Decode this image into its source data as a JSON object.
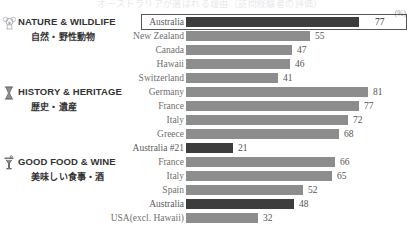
{
  "headline": "オーストラリアが選ばれる理由（訪問経験者の評価）",
  "unit": "(%)",
  "axis": {
    "baseline_px": 186,
    "px_per_unit": 2.25
  },
  "chart_data": {
    "type": "bar",
    "title": "",
    "xlabel": "(%)",
    "ylabel": "",
    "xlim": [
      0,
      100
    ],
    "grid": false,
    "legend": "none",
    "orientation": "horizontal",
    "sections": [
      {
        "icon": "koala-icon",
        "title_en": "NATURE & WILDLIFE",
        "title_ja": "自然・野性動物",
        "categories": [
          "Australia",
          "New Zealand",
          "Canada",
          "Hawaii",
          "Switzerland"
        ],
        "values": [
          77,
          55,
          47,
          46,
          41
        ],
        "highlight_index": 0,
        "boxed_index": 0
      },
      {
        "icon": "hourglass-icon",
        "title_en": "HISTORY & HERITAGE",
        "title_ja": "歴史・遺産",
        "categories": [
          "Germany",
          "France",
          "Italy",
          "Greece",
          "Australia #21"
        ],
        "values": [
          81,
          77,
          72,
          68,
          21
        ],
        "highlight_index": 4,
        "boxed_index": -1
      },
      {
        "icon": "cocktail-glass-icon",
        "title_en": "GOOD FOOD & WINE",
        "title_ja": "美味しい食事・酒",
        "categories": [
          "France",
          "Italy",
          "Spain",
          "Australia",
          "USA(excl. Hawaii)"
        ],
        "values": [
          66,
          65,
          52,
          48,
          32
        ],
        "highlight_index": 3,
        "boxed_index": -1
      }
    ]
  }
}
